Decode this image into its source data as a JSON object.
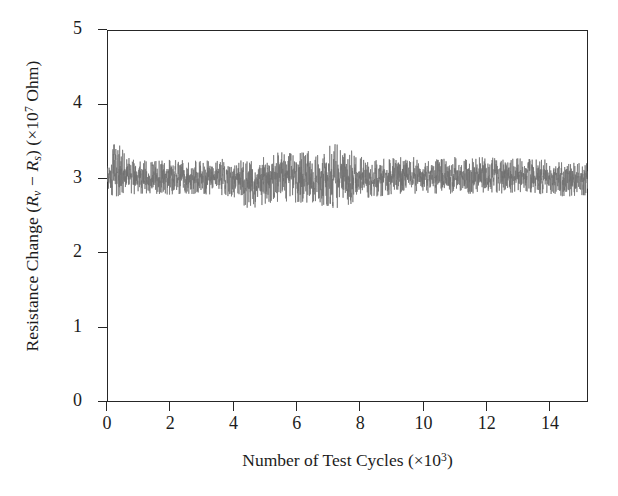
{
  "figure": {
    "background_color": "#ffffff",
    "axis_color": "#262626",
    "trace_color": "#707070"
  },
  "axes": {
    "y_title_prefix": "Resistance Change (",
    "y_title_var1": "R",
    "y_title_sub1": "v",
    "y_title_minus": " − ",
    "y_title_var2": "R",
    "y_title_sub2": "s",
    "y_title_mid": ") (×10",
    "y_title_exp": "7",
    "y_title_suffix": " Ohm)",
    "x_title_prefix": "Number of Test Cycles (×10",
    "x_title_exp": "3",
    "x_title_suffix": ")"
  },
  "chart_data": {
    "type": "line",
    "title": "",
    "subtitle": "",
    "xlabel": "Number of Test Cycles (×10^3)",
    "ylabel": "Resistance Change (R_v − R_s) (×10^7 Ohm)",
    "xlim": [
      0,
      15.2
    ],
    "ylim": [
      0,
      5
    ],
    "xticks": [
      0,
      2,
      4,
      6,
      8,
      10,
      12,
      14
    ],
    "xtick_labels": [
      "0",
      "2",
      "4",
      "6",
      "8",
      "10",
      "12",
      "14"
    ],
    "yticks": [
      0,
      1,
      2,
      3,
      4,
      5
    ],
    "ytick_labels": [
      "0",
      "1",
      "2",
      "3",
      "4",
      "5"
    ],
    "grid": false,
    "legend": null,
    "tick_direction": "out",
    "series": [
      {
        "name": "Resistance change during cycling",
        "color": "#707070",
        "line_width": 0.7,
        "description": "Dense high-frequency noise trace, flat baseline with no drift over 15000 test cycles",
        "mean": 3.0,
        "std": 0.12,
        "min": 2.55,
        "max": 3.58,
        "n_points": 3000,
        "envelope_x": [
          0.0,
          0.3,
          0.6,
          1.0,
          1.5,
          2.0,
          2.5,
          3.0,
          3.5,
          4.0,
          4.5,
          5.0,
          5.5,
          6.0,
          6.5,
          7.0,
          7.5,
          8.0,
          8.5,
          9.0,
          9.5,
          10.0,
          10.5,
          11.0,
          11.5,
          12.0,
          12.5,
          13.0,
          13.5,
          14.0,
          14.5,
          15.2
        ],
        "envelope_upper": [
          3.22,
          3.56,
          3.3,
          3.25,
          3.24,
          3.26,
          3.25,
          3.24,
          3.27,
          3.26,
          3.23,
          3.32,
          3.36,
          3.34,
          3.4,
          3.44,
          3.5,
          3.3,
          3.26,
          3.28,
          3.3,
          3.28,
          3.26,
          3.3,
          3.28,
          3.3,
          3.26,
          3.28,
          3.26,
          3.26,
          3.24,
          3.22
        ],
        "envelope_lower": [
          2.8,
          2.76,
          2.78,
          2.8,
          2.8,
          2.78,
          2.8,
          2.79,
          2.78,
          2.76,
          2.58,
          2.66,
          2.7,
          2.68,
          2.66,
          2.62,
          2.58,
          2.72,
          2.76,
          2.78,
          2.8,
          2.8,
          2.8,
          2.78,
          2.8,
          2.82,
          2.8,
          2.82,
          2.8,
          2.78,
          2.76,
          2.78
        ]
      }
    ]
  }
}
